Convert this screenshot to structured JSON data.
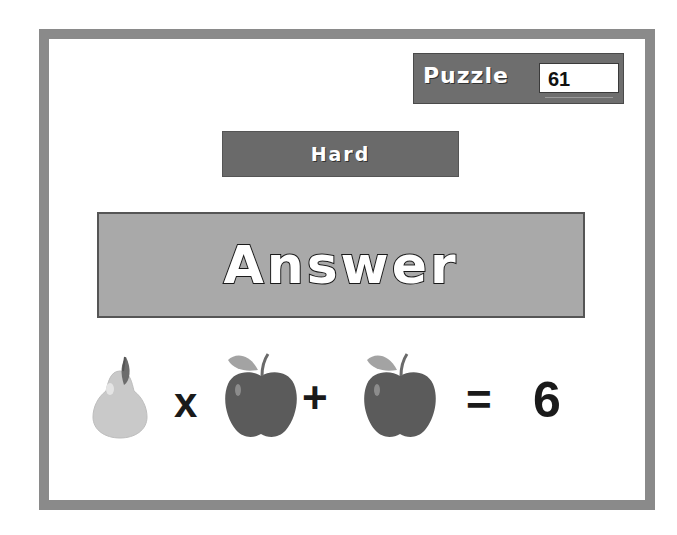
{
  "puzzle": {
    "label": "Puzzle",
    "number": "61"
  },
  "difficulty": {
    "label": "Hard"
  },
  "answer_button": {
    "label": "Answer"
  },
  "equation": {
    "terms": [
      {
        "type": "fruit",
        "name": "pear"
      },
      {
        "type": "operator",
        "symbol": "x"
      },
      {
        "type": "fruit",
        "name": "apple"
      },
      {
        "type": "operator",
        "symbol": "+"
      },
      {
        "type": "fruit",
        "name": "apple"
      },
      {
        "type": "operator",
        "symbol": "="
      },
      {
        "type": "number",
        "value": "6"
      }
    ],
    "times_symbol": "x",
    "plus_symbol": "+",
    "equals_symbol": "=",
    "result": "6"
  },
  "colors": {
    "frame": "#8a8a8a",
    "puzzle_box": "#6e6e6e",
    "difficulty_bar": "#6a6a6a",
    "answer_box": "#a9a9a9",
    "pear": "#c8c8c8",
    "apple": "#5a5a5a",
    "leaf": "#9a9a9a"
  }
}
